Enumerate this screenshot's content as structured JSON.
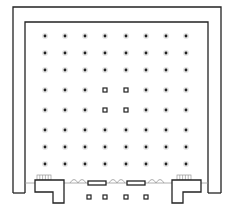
{
  "diagram": {
    "type": "floor-plan",
    "colors": {
      "wall": "#222222",
      "door": "#999999",
      "background": "#ffffff"
    },
    "walls": {
      "outer": {
        "left": 13,
        "top": 7,
        "right": 221,
        "bottom": 193
      },
      "inner": {
        "left": 25,
        "top": 22,
        "right": 208,
        "bottom": 180
      }
    },
    "column_grid": {
      "x": [
        45,
        65,
        85,
        105,
        126,
        146,
        166,
        186
      ],
      "y": [
        36,
        53,
        70,
        90,
        110,
        130,
        147,
        164
      ],
      "square_markers": [
        [
          3,
          3
        ],
        [
          4,
          3
        ],
        [
          3,
          4
        ],
        [
          4,
          4
        ]
      ],
      "bottom_row": {
        "y": 197,
        "x": [
          89,
          105,
          126,
          146
        ]
      }
    },
    "entrance": {
      "glass_panels": [
        {
          "x": 88,
          "y": 181,
          "w": 18,
          "h": 4
        },
        {
          "x": 127,
          "y": 181,
          "w": 18,
          "h": 4
        }
      ],
      "doors": [
        {
          "x": 70,
          "y": 180
        },
        {
          "x": 109,
          "y": 180
        },
        {
          "x": 148,
          "y": 180
        }
      ],
      "stairs": [
        {
          "x": 37,
          "y": 175
        },
        {
          "x": 177,
          "y": 175
        }
      ]
    },
    "vestibules": {
      "left": "M35,180 L64,180 L64,203 L53,203 L53,192 L35,192 Z",
      "right": "M172,180 L201,180 L201,192 L183,192 L183,203 L172,203 Z"
    }
  }
}
